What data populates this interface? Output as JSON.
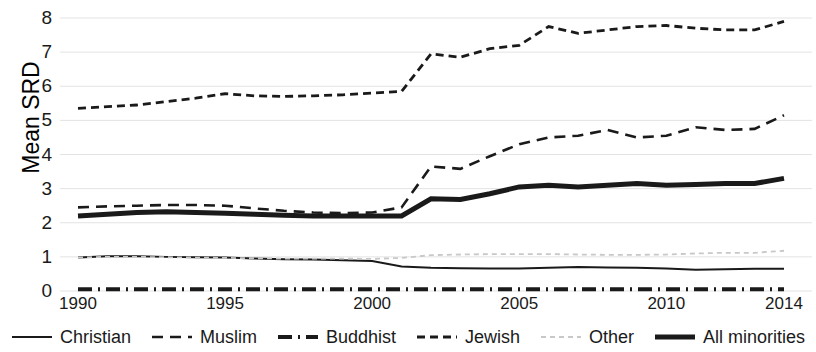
{
  "chart_data": {
    "type": "line",
    "title": "",
    "xlabel": "",
    "ylabel": "Mean SRD",
    "xlim": [
      1990,
      2014
    ],
    "ylim": [
      0,
      8
    ],
    "yticks": [
      0,
      1,
      2,
      3,
      4,
      5,
      6,
      7,
      8
    ],
    "xticks": [
      1990,
      1995,
      2000,
      2005,
      2010,
      2014
    ],
    "grid": "horizontal",
    "legend_position": "bottom",
    "x": [
      1990,
      1991,
      1992,
      1993,
      1994,
      1995,
      1996,
      1997,
      1998,
      1999,
      2000,
      2001,
      2002,
      2003,
      2004,
      2005,
      2006,
      2007,
      2008,
      2009,
      2010,
      2011,
      2012,
      2013,
      2014
    ],
    "series": [
      {
        "name": "Christian",
        "style": "solid-thin",
        "color": "#1a1a1a",
        "values": [
          0.98,
          1.02,
          1.02,
          1.0,
          0.99,
          0.98,
          0.95,
          0.93,
          0.92,
          0.9,
          0.88,
          0.72,
          0.68,
          0.67,
          0.66,
          0.66,
          0.68,
          0.7,
          0.69,
          0.68,
          0.66,
          0.62,
          0.64,
          0.65,
          0.65
        ]
      },
      {
        "name": "Muslim",
        "style": "long-dash",
        "color": "#1a1a1a",
        "values": [
          2.45,
          2.48,
          2.5,
          2.52,
          2.52,
          2.5,
          2.42,
          2.35,
          2.3,
          2.28,
          2.3,
          2.45,
          3.65,
          3.58,
          3.95,
          4.3,
          4.5,
          4.55,
          4.72,
          4.5,
          4.55,
          4.8,
          4.72,
          4.75,
          5.15
        ]
      },
      {
        "name": "Buddhist",
        "style": "dash-dot",
        "color": "#1a1a1a",
        "values": [
          0.05,
          0.05,
          0.05,
          0.05,
          0.05,
          0.05,
          0.05,
          0.05,
          0.05,
          0.05,
          0.05,
          0.05,
          0.05,
          0.05,
          0.05,
          0.05,
          0.05,
          0.05,
          0.05,
          0.05,
          0.05,
          0.05,
          0.05,
          0.05,
          0.05
        ]
      },
      {
        "name": "Jewish",
        "style": "short-dash",
        "color": "#1a1a1a",
        "values": [
          5.35,
          5.4,
          5.45,
          5.55,
          5.65,
          5.78,
          5.72,
          5.7,
          5.72,
          5.75,
          5.8,
          5.85,
          6.95,
          6.85,
          7.1,
          7.2,
          7.75,
          7.55,
          7.65,
          7.75,
          7.78,
          7.7,
          7.65,
          7.65,
          7.9
        ]
      },
      {
        "name": "Other",
        "style": "light-dot",
        "color": "#c8c8c8",
        "values": [
          0.98,
          1.0,
          1.0,
          0.99,
          0.98,
          0.97,
          0.96,
          0.95,
          0.95,
          0.95,
          0.94,
          0.97,
          1.05,
          1.07,
          1.08,
          1.08,
          1.08,
          1.07,
          1.06,
          1.06,
          1.07,
          1.1,
          1.12,
          1.12,
          1.18
        ]
      },
      {
        "name": "All minorities",
        "style": "solid-thick",
        "color": "#1a1a1a",
        "values": [
          2.2,
          2.25,
          2.3,
          2.32,
          2.3,
          2.28,
          2.25,
          2.22,
          2.2,
          2.2,
          2.2,
          2.2,
          2.7,
          2.68,
          2.85,
          3.05,
          3.1,
          3.05,
          3.1,
          3.15,
          3.1,
          3.12,
          3.15,
          3.15,
          3.3
        ]
      }
    ]
  },
  "legend": {
    "items": [
      {
        "label": "Christian"
      },
      {
        "label": "Muslim"
      },
      {
        "label": "Buddhist"
      },
      {
        "label": "Jewish"
      },
      {
        "label": "Other"
      },
      {
        "label": "All minorities"
      }
    ]
  }
}
